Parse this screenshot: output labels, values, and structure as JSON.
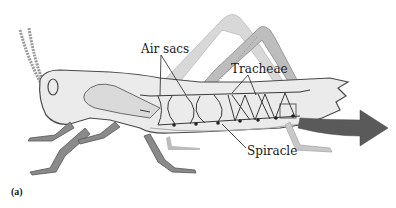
{
  "figure": {
    "panel_label": "(a)",
    "labels": {
      "air_sacs": "Air sacs",
      "tracheae": "Tracheae",
      "spiracle": "Spiracle"
    },
    "colors": {
      "body_fill": "#ebebeb",
      "body_stroke": "#4a4a4a",
      "leg_fill": "#8a8a8a",
      "faded_leg": "#cfcfcf",
      "trachea_stroke": "#3a3a3a",
      "arrow_fill": "#5a5a5a",
      "label_text": "#1a1a1a",
      "background": "#ffffff"
    }
  }
}
